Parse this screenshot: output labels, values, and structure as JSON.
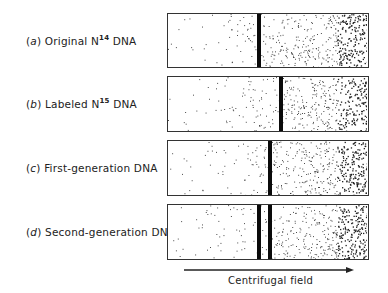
{
  "diagram": {
    "rows": [
      {
        "letter": "a",
        "prefix": "(",
        "suffix": ")",
        "text": "Original N",
        "isotope": "14",
        "after": " DNA",
        "bands": [
          257
        ]
      },
      {
        "letter": "b",
        "prefix": "(",
        "suffix": ")",
        "text": "Labeled N",
        "isotope": "15",
        "after": " DNA",
        "bands": [
          279
        ]
      },
      {
        "letter": "c",
        "prefix": "(",
        "suffix": ")",
        "text": "First-generation DNA",
        "isotope": "",
        "after": "",
        "bands": [
          268
        ]
      },
      {
        "letter": "d",
        "prefix": "(",
        "suffix": ")",
        "text": "Second-generation DNA",
        "isotope": "",
        "after": "",
        "bands": [
          257,
          268
        ]
      }
    ],
    "axis": {
      "label": "Centrifugal field",
      "direction": "right"
    },
    "colors": {
      "band": "#0a0a0a",
      "border": "#333333",
      "stipple": "#222222"
    }
  }
}
